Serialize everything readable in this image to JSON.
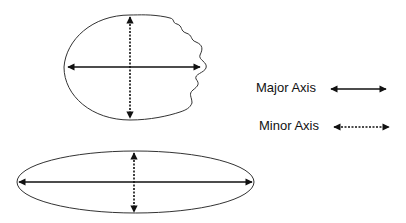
{
  "diagram": {
    "shapes": [
      {
        "name": "irregular-oval",
        "description": "Oval with wavy right edge showing major and minor axes"
      },
      {
        "name": "elongated-ellipse",
        "description": "Long flat ellipse showing major and minor axes"
      }
    ],
    "legend": [
      {
        "label": "Major Axis",
        "line_style": "solid"
      },
      {
        "label": "Minor Axis",
        "line_style": "dotted"
      }
    ],
    "colors": {
      "stroke": "#111111",
      "outline": "#333333",
      "background": "#ffffff"
    }
  }
}
